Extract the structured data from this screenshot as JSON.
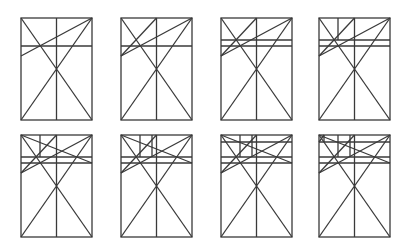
{
  "figure": {
    "stroke_color": "#3a3a3a",
    "background": "#ffffff",
    "panel_size": {
      "width": 71,
      "height": 102
    },
    "panels": [
      {
        "step": 1,
        "x": 21,
        "y": 18,
        "elements": [
          "frame",
          "center-vertical",
          "diagonals",
          "lineA",
          "H1"
        ]
      },
      {
        "step": 2,
        "x": 121,
        "y": 18,
        "elements": [
          "frame",
          "center-vertical",
          "diagonals",
          "lineA",
          "H1",
          "lineB"
        ]
      },
      {
        "step": 3,
        "x": 221,
        "y": 18,
        "elements": [
          "frame",
          "center-vertical",
          "diagonals",
          "lineA",
          "H1",
          "lineB",
          "H2"
        ]
      },
      {
        "step": 4,
        "x": 319,
        "y": 18,
        "elements": [
          "frame",
          "center-vertical",
          "diagonals",
          "lineA",
          "H1",
          "lineB",
          "H2",
          "V1"
        ]
      },
      {
        "step": 5,
        "x": 21,
        "y": 135,
        "elements": [
          "frame",
          "center-vertical",
          "diagonals",
          "lineA",
          "H1",
          "lineB",
          "H2",
          "V1",
          "lineC"
        ]
      },
      {
        "step": 6,
        "x": 121,
        "y": 135,
        "elements": [
          "frame",
          "center-vertical",
          "diagonals",
          "lineA",
          "H1",
          "lineB",
          "H2",
          "V1",
          "lineC",
          "V2"
        ]
      },
      {
        "step": 7,
        "x": 221,
        "y": 135,
        "elements": [
          "frame",
          "center-vertical",
          "diagonals",
          "lineA",
          "H1",
          "lineB",
          "H2",
          "V1",
          "lineC",
          "V2",
          "H3"
        ]
      },
      {
        "step": 8,
        "x": 319,
        "y": 135,
        "elements": [
          "frame",
          "center-vertical",
          "diagonals",
          "lineA",
          "H1",
          "lineB",
          "H2",
          "V1",
          "lineC",
          "V2",
          "H3",
          "corner"
        ]
      }
    ]
  }
}
